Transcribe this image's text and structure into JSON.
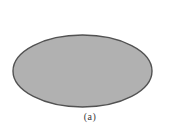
{
  "figure": {
    "shape": "ellipse",
    "ellipse": {
      "fill_color": "#b1b1b1",
      "stroke_color": "#525252"
    },
    "caption": "(a)",
    "background_color": "#ffffff"
  }
}
